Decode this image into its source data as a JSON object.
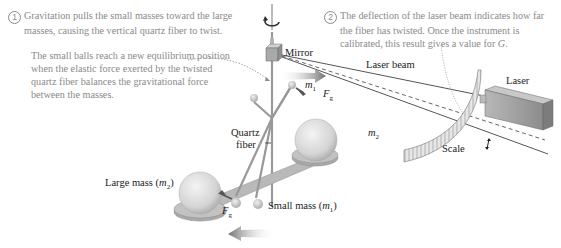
{
  "notes": {
    "note1": {
      "number": "1",
      "line1": "Gravitation pulls the small masses toward the large",
      "line2": "masses, causing the vertical quartz fiber to twist."
    },
    "note1b": {
      "line1": "The small balls reach a new equilibrium position",
      "line2": "when the elastic force exerted by the twisted",
      "line3": "quartz fiber balances the gravitational force",
      "line4": "between the masses."
    },
    "note2": {
      "number": "2",
      "line1": "The deflection of the laser beam indicates how far",
      "line2": "the fiber has twisted. Once the instrument is",
      "line3_pre": "calibrated, this result gives a value for ",
      "line3_var": "G",
      "line3_post": "."
    }
  },
  "labels": {
    "mirror": "Mirror",
    "laser_beam": "Laser beam",
    "laser": "Laser",
    "scale": "Scale",
    "quartz": "Quartz",
    "fiber": "fiber",
    "large_mass_pre": "Large mass (",
    "large_mass_var": "m",
    "large_mass_sub": "2",
    "large_mass_post": ")",
    "small_mass_pre": "Small mass (",
    "small_mass_var": "m",
    "small_mass_sub": "1",
    "small_mass_post": ")",
    "m1_var": "m",
    "m1_sub": "1",
    "m2_var": "m",
    "m2_sub": "2",
    "fg_top_var": "F",
    "fg_top_sub": "g",
    "fg_bottom_var": "F",
    "fg_bottom_sub": "g"
  },
  "colors": {
    "note_text": "#8a8a8a",
    "label_text": "#222222",
    "arrow_gray": "#7d7d7d",
    "sphere": "#d9d9d9",
    "laser_box": "#9a9a9a"
  }
}
